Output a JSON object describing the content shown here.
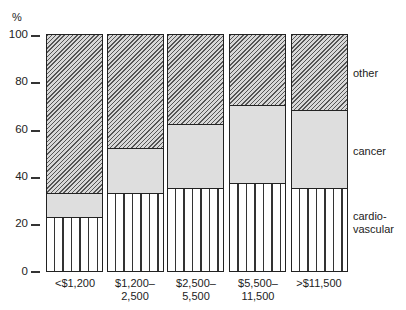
{
  "chart_data": {
    "type": "bar",
    "stacked": true,
    "title": "",
    "xlabel": "",
    "ylabel": "%",
    "ylim": [
      0,
      100
    ],
    "yticks": [
      0,
      20,
      40,
      60,
      80,
      100
    ],
    "grid": false,
    "legend_position": "right (inline labels)",
    "categories": [
      "<$1,200",
      "$1,200–2,500",
      "$2,500–5,500",
      "$5,500–11,500",
      ">$11,500"
    ],
    "category_label_lines": [
      [
        "<$1,200"
      ],
      [
        "$1,200–",
        "2,500"
      ],
      [
        "$2,500–",
        "5,500"
      ],
      [
        "$5,500–",
        "11,500"
      ],
      [
        ">$11,500"
      ]
    ],
    "series": [
      {
        "name": "cardio-vascular",
        "values": [
          23,
          33,
          35,
          37,
          35
        ],
        "pattern": "vertical-stripes"
      },
      {
        "name": "cancer",
        "values": [
          10,
          19,
          27,
          33,
          33
        ],
        "pattern": "light-stipple"
      },
      {
        "name": "other",
        "values": [
          67,
          48,
          38,
          30,
          32
        ],
        "pattern": "diagonal-hatch"
      }
    ],
    "cumulative_boundaries": {
      "cardio_top": [
        23,
        33,
        35,
        37,
        35
      ],
      "cancer_top": [
        33,
        52,
        62,
        70,
        68
      ]
    }
  },
  "axis": {
    "unit": "%",
    "tick_labels": [
      "100",
      "80",
      "60",
      "40",
      "20",
      "0"
    ]
  },
  "legend": {
    "other": "other",
    "cancer": "cancer",
    "cardio_line1": "cardio-",
    "cardio_line2": "vascular"
  },
  "xlabels": {
    "c0_l1": "<$1,200",
    "c1_l1": "$1,200–",
    "c1_l2": "2,500",
    "c2_l1": "$2,500–",
    "c2_l2": "5,500",
    "c3_l1": "$5,500–",
    "c3_l2": "11,500",
    "c4_l1": ">$11,500"
  }
}
